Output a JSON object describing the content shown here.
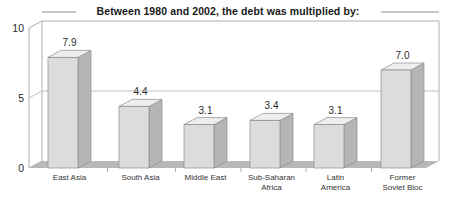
{
  "chart_data": {
    "type": "bar",
    "title": "Between 1980 and 2002, the debt was multiplied by:",
    "subtitle": "",
    "xlabel": "",
    "ylabel": "",
    "ylim": [
      0,
      10
    ],
    "yticks": [
      "0",
      "5",
      "10"
    ],
    "grid": true,
    "legend": "none",
    "style": "3d-column",
    "categories": [
      "East Asia",
      "South Asia",
      "Middle East",
      "Sub-Saharan Africa",
      "Latin America",
      "Former Soviet Bloc"
    ],
    "category_lines": [
      [
        "East Asia"
      ],
      [
        "South Asia"
      ],
      [
        "Middle East"
      ],
      [
        "Sub-Saharan",
        "Africa"
      ],
      [
        "Latin",
        "America"
      ],
      [
        "Former",
        "Soviet Bloc"
      ]
    ],
    "values": [
      7.9,
      4.4,
      3.1,
      3.4,
      3.1,
      7.0
    ],
    "value_labels": [
      "7.9",
      "4.4",
      "3.1",
      "3.4",
      "3.1",
      "7.0"
    ]
  },
  "colors": {
    "bar_front": "#dcdcdc",
    "bar_top": "#eeeeee",
    "bar_side": "#b5b5b5",
    "bar_outline": "#8c8c8c",
    "floor": "#b8b8b8",
    "frame": "#aeaeae",
    "grid": "#c2c2c2",
    "text": "#2b2b2b",
    "background": "#ffffff"
  }
}
